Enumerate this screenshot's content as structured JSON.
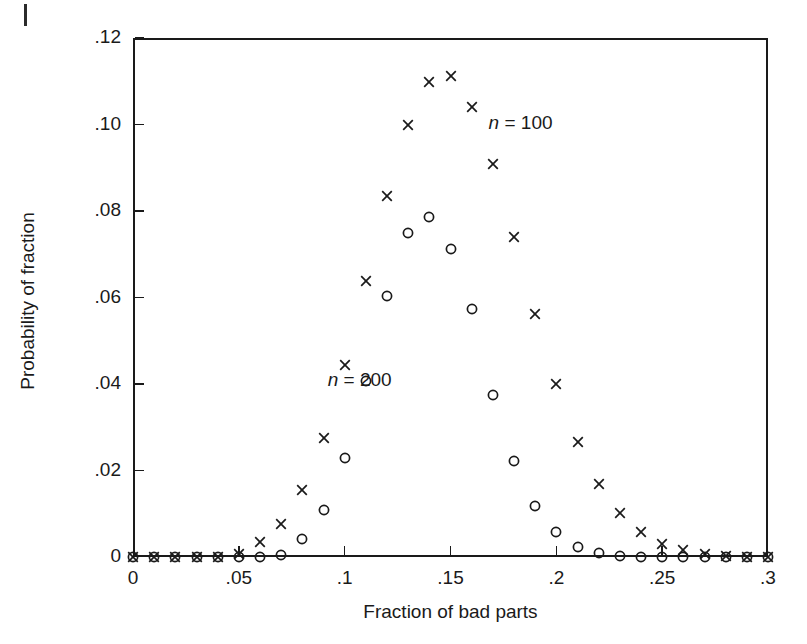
{
  "chart_data": {
    "type": "scatter",
    "title": "",
    "xlabel": "Fraction of bad parts",
    "ylabel": "Probability of fraction",
    "xlim": [
      0,
      0.3
    ],
    "ylim": [
      0,
      0.12
    ],
    "grid": false,
    "legend_position": "inline-annotation",
    "xticks": [
      0,
      0.05,
      0.1,
      0.15,
      0.2,
      0.25,
      0.3
    ],
    "xticklabels": [
      "0",
      ".05",
      ".1",
      ".15",
      ".2",
      ".25",
      ".3"
    ],
    "yticks": [
      0,
      0.02,
      0.04,
      0.06,
      0.08,
      0.1,
      0.12
    ],
    "yticklabels": [
      "0",
      ".02",
      ".04",
      ".06",
      ".08",
      ".10",
      ".12"
    ],
    "x": [
      0,
      0.01,
      0.02,
      0.03,
      0.04,
      0.05,
      0.06,
      0.07,
      0.08,
      0.09,
      0.1,
      0.11,
      0.12,
      0.13,
      0.14,
      0.15,
      0.16,
      0.17,
      0.18,
      0.19,
      0.2,
      0.21,
      0.22,
      0.23,
      0.24,
      0.25,
      0.26,
      0.27,
      0.28,
      0.29,
      0.3
    ],
    "series": [
      {
        "name": "n = 100",
        "marker": "x",
        "annotation": "n = 100",
        "annotation_x": 0.168,
        "annotation_y": 0.1,
        "values": [
          0,
          0,
          0,
          0,
          0.0001,
          0.0006,
          0.0034,
          0.0076,
          0.0155,
          0.0275,
          0.0444,
          0.0639,
          0.0834,
          0.0999,
          0.1098,
          0.1111,
          0.1041,
          0.0908,
          0.0739,
          0.0563,
          0.0399,
          0.0267,
          0.0169,
          0.0101,
          0.0057,
          0.0031,
          0.0016,
          0.0007,
          0.0003,
          0.0001,
          0
        ]
      },
      {
        "name": "n = 200",
        "marker": "o",
        "annotation": "n = 200",
        "annotation_x": 0.092,
        "annotation_y": 0.0405,
        "values": [
          0,
          0,
          0,
          0,
          0,
          0,
          0.0001,
          0.0005,
          0.0042,
          0.0109,
          0.0229,
          0.0407,
          0.0603,
          0.0748,
          0.0785,
          0.0711,
          0.0574,
          0.0375,
          0.0222,
          0.0119,
          0.0057,
          0.0024,
          0.0009,
          0.0003,
          0.0001,
          0,
          0,
          0,
          0,
          0,
          0
        ]
      }
    ]
  },
  "axes": {
    "x_title": "Fraction of bad parts",
    "y_title": "Probability of fraction"
  }
}
